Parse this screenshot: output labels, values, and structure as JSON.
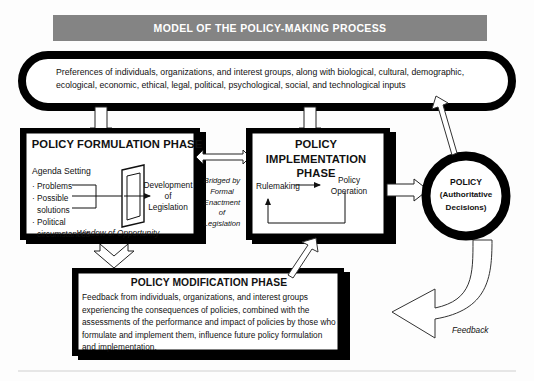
{
  "title": {
    "banner_text": "MODEL OF THE POLICY-MAKING PROCESS",
    "banner_bg": "#848484",
    "banner_fg": "#ffffff"
  },
  "inputs_oval": {
    "name": "preferences-oval",
    "text": "Preferences of individuals, organizations, and interest groups, along with biological, cultural, demographic, ecological, economic, ethical, legal, political, psychological, social, and technological inputs"
  },
  "formulation_phase": {
    "title": "POLICY FORMULATION PHASE",
    "agenda_heading": "Agenda Setting",
    "bullets": [
      "· Problems",
      "· Possible",
      "solutions",
      "· Political",
      "circumstances"
    ],
    "output_label": "Development\nof\nLegislation",
    "output_label_lines": [
      "Development",
      "of",
      "Legislation"
    ],
    "window_label": "Window of Opportunity"
  },
  "bridge": {
    "label_lines": [
      "Bridged by",
      "Formal",
      "Enactment",
      "of",
      "Legislation"
    ]
  },
  "implementation_phase": {
    "title_lines": [
      "POLICY IMPLEMENTATION",
      "PHASE"
    ],
    "rulemaking_label": "Rulemaking",
    "operation_label_lines": [
      "Policy",
      "Operation"
    ]
  },
  "policy_circle": {
    "title": "POLICY",
    "subtitle_lines": [
      "(Authoritative",
      "Decisions)"
    ]
  },
  "modification_phase": {
    "title": "POLICY MODIFICATION PHASE",
    "body": "Feedback from individuals, organizations, and interest groups experiencing the consequences of policies, combined with the assessments of the performance and impact of policies by those who formulate and implement them, influence future policy formulation and implementation."
  },
  "feedback": {
    "label": "Feedback"
  },
  "colors": {
    "ink": "#111111",
    "shadow": "#000000",
    "page": "#fdfdfd",
    "rule": "#cfcfcf"
  }
}
